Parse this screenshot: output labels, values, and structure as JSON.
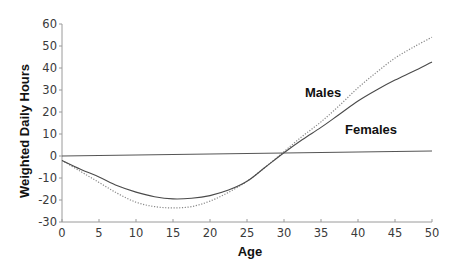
{
  "chart_data": {
    "type": "line",
    "title": "",
    "xlabel": "Age",
    "ylabel": "Weighted Daily Hours",
    "xlim": [
      0,
      50
    ],
    "ylim": [
      -30,
      60
    ],
    "x_ticks": [
      0,
      5,
      10,
      15,
      20,
      25,
      30,
      35,
      40,
      45,
      50
    ],
    "y_ticks": [
      -30,
      -20,
      -10,
      0,
      10,
      20,
      30,
      40,
      50,
      60
    ],
    "grid": false,
    "legend": "inline labels",
    "x": [
      0,
      2.5,
      5,
      7.5,
      10,
      12.5,
      15,
      17.5,
      20,
      22.5,
      25,
      27.5,
      30,
      32.5,
      35,
      37.5,
      40,
      42.5,
      45,
      47.5,
      50
    ],
    "series": [
      {
        "name": "Males",
        "style": "dotted",
        "color": "#888888",
        "values": [
          -2,
          -7,
          -12,
          -17,
          -21,
          -23,
          -23.6,
          -23,
          -20.5,
          -16.5,
          -11.5,
          -5,
          2,
          9,
          15.5,
          23,
          31,
          38,
          44.5,
          49.5,
          54
        ]
      },
      {
        "name": "Females",
        "style": "solid",
        "color": "#4a4a4a",
        "values": [
          -2,
          -6,
          -9.5,
          -13.5,
          -16.4,
          -18.5,
          -19.5,
          -19.2,
          -18,
          -15.5,
          -11.5,
          -5,
          1.5,
          7.5,
          13,
          19,
          25,
          30,
          34.5,
          38.5,
          42.7
        ]
      },
      {
        "name": "Baseline",
        "style": "solid",
        "color": "#555555",
        "values": [
          0,
          0.1,
          0.2,
          0.35,
          0.45,
          0.55,
          0.7,
          0.8,
          0.9,
          1.0,
          1.1,
          1.25,
          1.35,
          1.45,
          1.55,
          1.7,
          1.8,
          1.9,
          2.0,
          2.15,
          2.3
        ]
      }
    ],
    "annotations": [
      {
        "text": "Males",
        "x": 33,
        "y": 28
      },
      {
        "text": "Females",
        "x": 38.5,
        "y": 13
      }
    ]
  },
  "labels": {
    "ylabel": "Weighted Daily Hours",
    "xlabel": "Age",
    "males": "Males",
    "females": "Females"
  }
}
